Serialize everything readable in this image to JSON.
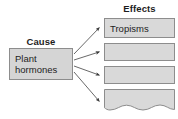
{
  "diagram": {
    "type": "cause-and-effect-chart",
    "background_color": "#ffffff",
    "box_fill_color": "#d9d9d9",
    "box_border_color": "#8d8d8d",
    "arrow_color": "#4a4a4a",
    "text_color": "#1d1d1d",
    "cause_column": {
      "heading": "Cause",
      "node": {
        "label": "Plant\nhormones"
      }
    },
    "effects_column": {
      "heading": "Effects",
      "nodes": [
        {
          "label": "Tropisms",
          "empty": false
        },
        {
          "label": "",
          "empty": true
        },
        {
          "label": "",
          "empty": true
        },
        {
          "label": "",
          "empty": true,
          "truncated_bottom": true
        }
      ]
    },
    "arrows": [
      {
        "from": "Plant hormones",
        "to": "Tropisms"
      },
      {
        "from": "Plant hormones",
        "to": "effect-2"
      },
      {
        "from": "Plant hormones",
        "to": "effect-3"
      },
      {
        "from": "Plant hormones",
        "to": "effect-4"
      }
    ]
  }
}
